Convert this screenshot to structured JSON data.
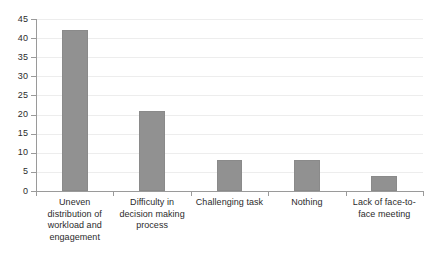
{
  "chart_data": {
    "type": "bar",
    "title": "",
    "subtitle": "",
    "xlabel": "",
    "ylabel": "",
    "categories": [
      "Uneven distribution of workload and engagement",
      "Difficulty in decision making process",
      "Challenging task",
      "Nothing",
      "Lack of face-to-face meeting"
    ],
    "values": [
      42,
      21,
      8,
      8,
      4
    ],
    "ylim": [
      0,
      45
    ],
    "ytick_labels": [
      "0",
      "5",
      "10",
      "15",
      "20",
      "25",
      "30",
      "35",
      "40",
      "45"
    ],
    "ytick_values": [
      0,
      5,
      10,
      15,
      20,
      25,
      30,
      35,
      40,
      45
    ],
    "grid": true,
    "legend": false,
    "legend_position": "none",
    "bar_color": "#919191",
    "gridline_color": "#ededed",
    "axis_color": "#9a9a9a",
    "text_color": "#2b2b2b",
    "background": "#ffffff"
  }
}
